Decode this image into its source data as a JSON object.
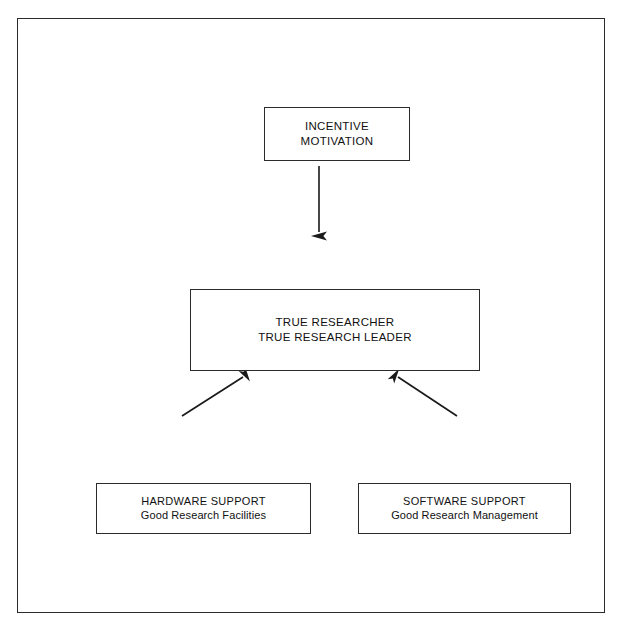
{
  "diagram": {
    "title_present": false,
    "background_color": "#ffffff",
    "frame_color": "#2b2b2b",
    "line_color": "#1a1a1a",
    "nodes": {
      "incentive": {
        "line1": "INCENTIVE",
        "line2": "MOTIVATION"
      },
      "researcher": {
        "line1": "TRUE RESEARCHER",
        "line2": "TRUE RESEARCH LEADER"
      },
      "hardware": {
        "title": "HARDWARE SUPPORT",
        "subtitle": "Good Research Facilities"
      },
      "software": {
        "title": "SOFTWARE SUPPORT",
        "subtitle": "Good Research Management"
      }
    },
    "arrows": [
      {
        "name": "incentive-to-researcher",
        "from": "incentive",
        "to": "researcher",
        "direction": "down"
      },
      {
        "name": "hardware-to-researcher",
        "from": "hardware",
        "to": "researcher",
        "direction": "up-right"
      },
      {
        "name": "software-to-researcher",
        "from": "software",
        "to": "researcher",
        "direction": "up-left"
      }
    ]
  }
}
